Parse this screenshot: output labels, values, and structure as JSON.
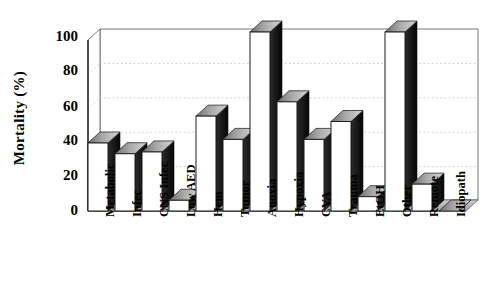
{
  "chart_data": {
    "type": "bar",
    "title": "",
    "xlabel": "",
    "ylabel": "Mortality (%)",
    "ylim": [
      0,
      100
    ],
    "yticks": [
      0,
      20,
      40,
      60,
      80,
      100
    ],
    "grid": true,
    "legend": "none",
    "three_d": true,
    "categories": [
      "Metabolic",
      "Infec",
      "CNS Infec",
      "Low AED",
      "Hem",
      "Tumor",
      "Anoxia",
      "Hypoxia",
      "CVA",
      "Trauma",
      "EtOH",
      "Other",
      "Remote",
      "Idiopath"
    ],
    "values": [
      38,
      32,
      33,
      6,
      53,
      40,
      100,
      61,
      40,
      50,
      8,
      100,
      15,
      0
    ],
    "colors": {
      "bar_front": "#ffffff",
      "bar_top": "#9a9a9a",
      "bar_side": "#1a1a1a",
      "axis": "#000000",
      "grid": "#b9b9b9",
      "background": "#ffffff"
    }
  },
  "axis": {
    "y_title": "Mortality (%)",
    "tick_labels": [
      "100",
      "80",
      "60",
      "40",
      "20",
      "0"
    ]
  }
}
